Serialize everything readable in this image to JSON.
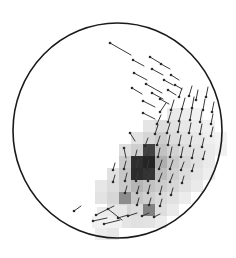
{
  "figure": {
    "title": "",
    "background_color": "#ffffff",
    "width": 236,
    "height": 258
  },
  "disk": {
    "label": "field-of-view-limb",
    "center_x": 117.5,
    "center_y": 130.5,
    "radius_x": 104.5,
    "radius_y": 107.5,
    "stroke_color": "#1a1a1a",
    "stroke_width": 1.6,
    "fill_color": "#ffffff"
  },
  "chart_data": {
    "type": "heatmap",
    "title": "",
    "xlabel": "",
    "ylabel": "",
    "grid": false,
    "legend_position": "none",
    "cell_size": 12,
    "origin_x": 83,
    "origin_y": 108,
    "colormap": "grayscale",
    "value_range": [
      0,
      1
    ],
    "color_stops": [
      {
        "value": 0.0,
        "hex": "#ffffff"
      },
      {
        "value": 0.15,
        "hex": "#ededed"
      },
      {
        "value": 0.3,
        "hex": "#dcdcdc"
      },
      {
        "value": 0.45,
        "hex": "#c4c4c4"
      },
      {
        "value": 0.6,
        "hex": "#a3a3a3"
      },
      {
        "value": 0.75,
        "hex": "#7a7a7a"
      },
      {
        "value": 0.9,
        "hex": "#4a4a4a"
      },
      {
        "value": 1.0,
        "hex": "#242424"
      }
    ],
    "cells": [
      {
        "col": 7,
        "row": 0,
        "value": 0.18
      },
      {
        "col": 8,
        "row": 0,
        "value": 0.14
      },
      {
        "col": 9,
        "row": 0,
        "value": 0.1
      },
      {
        "col": 5,
        "row": 1,
        "value": 0.22
      },
      {
        "col": 6,
        "row": 1,
        "value": 0.3
      },
      {
        "col": 7,
        "row": 1,
        "value": 0.26
      },
      {
        "col": 8,
        "row": 1,
        "value": 0.2
      },
      {
        "col": 9,
        "row": 1,
        "value": 0.16
      },
      {
        "col": 10,
        "row": 1,
        "value": 0.12
      },
      {
        "col": 4,
        "row": 2,
        "value": 0.24
      },
      {
        "col": 5,
        "row": 2,
        "value": 0.34
      },
      {
        "col": 6,
        "row": 2,
        "value": 0.4
      },
      {
        "col": 7,
        "row": 2,
        "value": 0.3
      },
      {
        "col": 8,
        "row": 2,
        "value": 0.24
      },
      {
        "col": 9,
        "row": 2,
        "value": 0.2
      },
      {
        "col": 10,
        "row": 2,
        "value": 0.14
      },
      {
        "col": 11,
        "row": 2,
        "value": 0.1
      },
      {
        "col": 3,
        "row": 3,
        "value": 0.28
      },
      {
        "col": 4,
        "row": 3,
        "value": 0.38
      },
      {
        "col": 5,
        "row": 3,
        "value": 0.92
      },
      {
        "col": 6,
        "row": 3,
        "value": 0.46
      },
      {
        "col": 7,
        "row": 3,
        "value": 0.36
      },
      {
        "col": 8,
        "row": 3,
        "value": 0.28
      },
      {
        "col": 9,
        "row": 3,
        "value": 0.24
      },
      {
        "col": 10,
        "row": 3,
        "value": 0.18
      },
      {
        "col": 11,
        "row": 3,
        "value": 0.12
      },
      {
        "col": 3,
        "row": 4,
        "value": 0.4
      },
      {
        "col": 4,
        "row": 4,
        "value": 0.97
      },
      {
        "col": 5,
        "row": 4,
        "value": 1.0
      },
      {
        "col": 6,
        "row": 4,
        "value": 0.55
      },
      {
        "col": 7,
        "row": 4,
        "value": 0.42
      },
      {
        "col": 8,
        "row": 4,
        "value": 0.34
      },
      {
        "col": 9,
        "row": 4,
        "value": 0.26
      },
      {
        "col": 10,
        "row": 4,
        "value": 0.18
      },
      {
        "col": 2,
        "row": 5,
        "value": 0.26
      },
      {
        "col": 3,
        "row": 5,
        "value": 0.44
      },
      {
        "col": 4,
        "row": 5,
        "value": 0.98
      },
      {
        "col": 5,
        "row": 5,
        "value": 0.96
      },
      {
        "col": 6,
        "row": 5,
        "value": 0.48
      },
      {
        "col": 7,
        "row": 5,
        "value": 0.38
      },
      {
        "col": 8,
        "row": 5,
        "value": 0.3
      },
      {
        "col": 9,
        "row": 5,
        "value": 0.22
      },
      {
        "col": 10,
        "row": 5,
        "value": 0.14
      },
      {
        "col": 1,
        "row": 6,
        "value": 0.2
      },
      {
        "col": 2,
        "row": 6,
        "value": 0.3
      },
      {
        "col": 3,
        "row": 6,
        "value": 0.42
      },
      {
        "col": 4,
        "row": 6,
        "value": 0.52
      },
      {
        "col": 5,
        "row": 6,
        "value": 0.46
      },
      {
        "col": 6,
        "row": 6,
        "value": 0.4
      },
      {
        "col": 7,
        "row": 6,
        "value": 0.34
      },
      {
        "col": 8,
        "row": 6,
        "value": 0.26
      },
      {
        "col": 9,
        "row": 6,
        "value": 0.18
      },
      {
        "col": 1,
        "row": 7,
        "value": 0.24
      },
      {
        "col": 2,
        "row": 7,
        "value": 0.34
      },
      {
        "col": 3,
        "row": 7,
        "value": 0.68
      },
      {
        "col": 4,
        "row": 7,
        "value": 0.44
      },
      {
        "col": 5,
        "row": 7,
        "value": 0.38
      },
      {
        "col": 6,
        "row": 7,
        "value": 0.32
      },
      {
        "col": 7,
        "row": 7,
        "value": 0.26
      },
      {
        "col": 8,
        "row": 7,
        "value": 0.16
      },
      {
        "col": 2,
        "row": 8,
        "value": 0.26
      },
      {
        "col": 3,
        "row": 8,
        "value": 0.34
      },
      {
        "col": 4,
        "row": 8,
        "value": 0.3
      },
      {
        "col": 5,
        "row": 8,
        "value": 0.72
      },
      {
        "col": 6,
        "row": 8,
        "value": 0.28
      },
      {
        "col": 7,
        "row": 8,
        "value": 0.18
      },
      {
        "col": 3,
        "row": 9,
        "value": 0.22
      },
      {
        "col": 4,
        "row": 9,
        "value": 0.26
      },
      {
        "col": 5,
        "row": 9,
        "value": 0.24
      },
      {
        "col": 6,
        "row": 9,
        "value": 0.16
      },
      {
        "col": 1,
        "row": 10,
        "value": 0.16
      },
      {
        "col": 2,
        "row": 10,
        "value": 0.2
      }
    ],
    "vectors_note": "Overlaid vector field: each glyph is a line segment with a filled dot marking its base point.",
    "vectors": [
      {
        "x": 110,
        "y": 43,
        "dx": 21,
        "dy": 12
      },
      {
        "x": 133,
        "y": 60,
        "dx": 11,
        "dy": 6
      },
      {
        "x": 150,
        "y": 57,
        "dx": 10,
        "dy": 6
      },
      {
        "x": 134,
        "y": 73,
        "dx": 13,
        "dy": 7
      },
      {
        "x": 152,
        "y": 69,
        "dx": 11,
        "dy": 6
      },
      {
        "x": 161,
        "y": 64,
        "dx": 9,
        "dy": 5
      },
      {
        "x": 146,
        "y": 84,
        "dx": 16,
        "dy": 9
      },
      {
        "x": 164,
        "y": 80,
        "dx": 9,
        "dy": 5
      },
      {
        "x": 171,
        "y": 75,
        "dx": 8,
        "dy": 5
      },
      {
        "x": 132,
        "y": 88,
        "dx": 10,
        "dy": 6
      },
      {
        "x": 152,
        "y": 93,
        "dx": 11,
        "dy": 6
      },
      {
        "x": 168,
        "y": 90,
        "dx": 8,
        "dy": 5
      },
      {
        "x": 175,
        "y": 85,
        "dx": 7,
        "dy": 4
      },
      {
        "x": 143,
        "y": 101,
        "dx": 12,
        "dy": 6
      },
      {
        "x": 160,
        "y": 99,
        "dx": 9,
        "dy": 5
      },
      {
        "x": 179,
        "y": 97,
        "dx": 3,
        "dy": -9
      },
      {
        "x": 189,
        "y": 96,
        "dx": 3,
        "dy": -10
      },
      {
        "x": 196,
        "y": 100,
        "dx": 2,
        "dy": -10
      },
      {
        "x": 206,
        "y": 97,
        "dx": 2,
        "dy": -10
      },
      {
        "x": 143,
        "y": 113,
        "dx": 12,
        "dy": 6
      },
      {
        "x": 160,
        "y": 112,
        "dx": 6,
        "dy": -9
      },
      {
        "x": 171,
        "y": 110,
        "dx": 3,
        "dy": -10
      },
      {
        "x": 182,
        "y": 109,
        "dx": 3,
        "dy": -11
      },
      {
        "x": 192,
        "y": 108,
        "dx": 2,
        "dy": -11
      },
      {
        "x": 203,
        "y": 110,
        "dx": 2,
        "dy": -11
      },
      {
        "x": 212,
        "y": 112,
        "dx": 2,
        "dy": -10
      },
      {
        "x": 157,
        "y": 124,
        "dx": 4,
        "dy": -9
      },
      {
        "x": 168,
        "y": 122,
        "dx": 3,
        "dy": -10
      },
      {
        "x": 179,
        "y": 121,
        "dx": 3,
        "dy": -11
      },
      {
        "x": 190,
        "y": 120,
        "dx": 2,
        "dy": -11
      },
      {
        "x": 200,
        "y": 122,
        "dx": 2,
        "dy": -11
      },
      {
        "x": 211,
        "y": 124,
        "dx": 2,
        "dy": -10
      },
      {
        "x": 130,
        "y": 133,
        "dx": 5,
        "dy": 8
      },
      {
        "x": 155,
        "y": 134,
        "dx": 3,
        "dy": -9
      },
      {
        "x": 167,
        "y": 133,
        "dx": 3,
        "dy": -10
      },
      {
        "x": 178,
        "y": 132,
        "dx": 2,
        "dy": -10
      },
      {
        "x": 189,
        "y": 133,
        "dx": 2,
        "dy": -10
      },
      {
        "x": 200,
        "y": 134,
        "dx": 2,
        "dy": -10
      },
      {
        "x": 211,
        "y": 136,
        "dx": 2,
        "dy": -9
      },
      {
        "x": 124,
        "y": 148,
        "dx": 2,
        "dy": 10
      },
      {
        "x": 145,
        "y": 146,
        "dx": 3,
        "dy": -8
      },
      {
        "x": 157,
        "y": 145,
        "dx": 3,
        "dy": -9
      },
      {
        "x": 168,
        "y": 145,
        "dx": 2,
        "dy": -10
      },
      {
        "x": 179,
        "y": 145,
        "dx": 2,
        "dy": -10
      },
      {
        "x": 190,
        "y": 146,
        "dx": 2,
        "dy": -10
      },
      {
        "x": 202,
        "y": 147,
        "dx": 2,
        "dy": -9
      },
      {
        "x": 135,
        "y": 158,
        "dx": 2,
        "dy": -8
      },
      {
        "x": 147,
        "y": 157,
        "dx": 2,
        "dy": -9
      },
      {
        "x": 158,
        "y": 157,
        "dx": 2,
        "dy": -9
      },
      {
        "x": 170,
        "y": 157,
        "dx": 2,
        "dy": -10
      },
      {
        "x": 181,
        "y": 157,
        "dx": 2,
        "dy": -10
      },
      {
        "x": 192,
        "y": 158,
        "dx": 2,
        "dy": -9
      },
      {
        "x": 203,
        "y": 159,
        "dx": 2,
        "dy": -8
      },
      {
        "x": 113,
        "y": 170,
        "dx": 2,
        "dy": -7
      },
      {
        "x": 124,
        "y": 169,
        "dx": 2,
        "dy": -8
      },
      {
        "x": 136,
        "y": 169,
        "dx": 2,
        "dy": -8
      },
      {
        "x": 147,
        "y": 169,
        "dx": 2,
        "dy": -9
      },
      {
        "x": 159,
        "y": 169,
        "dx": 3,
        "dy": -9
      },
      {
        "x": 170,
        "y": 169,
        "dx": 3,
        "dy": -9
      },
      {
        "x": 181,
        "y": 170,
        "dx": 3,
        "dy": -8
      },
      {
        "x": 192,
        "y": 171,
        "dx": 2,
        "dy": -7
      },
      {
        "x": 113,
        "y": 182,
        "dx": 2,
        "dy": -7
      },
      {
        "x": 125,
        "y": 181,
        "dx": 2,
        "dy": -8
      },
      {
        "x": 136,
        "y": 181,
        "dx": 2,
        "dy": -8
      },
      {
        "x": 148,
        "y": 181,
        "dx": 2,
        "dy": -8
      },
      {
        "x": 159,
        "y": 181,
        "dx": 3,
        "dy": -8
      },
      {
        "x": 170,
        "y": 182,
        "dx": 3,
        "dy": -8
      },
      {
        "x": 182,
        "y": 183,
        "dx": 2,
        "dy": -7
      },
      {
        "x": 125,
        "y": 193,
        "dx": 2,
        "dy": -7
      },
      {
        "x": 137,
        "y": 193,
        "dx": 2,
        "dy": -7
      },
      {
        "x": 148,
        "y": 193,
        "dx": 2,
        "dy": -8
      },
      {
        "x": 160,
        "y": 194,
        "dx": 2,
        "dy": -8
      },
      {
        "x": 171,
        "y": 195,
        "dx": 2,
        "dy": -7
      },
      {
        "x": 137,
        "y": 205,
        "dx": 2,
        "dy": -7
      },
      {
        "x": 149,
        "y": 205,
        "dx": 2,
        "dy": -7
      },
      {
        "x": 160,
        "y": 206,
        "dx": 2,
        "dy": -7
      },
      {
        "x": 74,
        "y": 211,
        "dx": 7,
        "dy": -5
      },
      {
        "x": 93,
        "y": 221,
        "dx": 14,
        "dy": -3
      },
      {
        "x": 96,
        "y": 215,
        "dx": 18,
        "dy": -9
      },
      {
        "x": 104,
        "y": 224,
        "dx": 16,
        "dy": -4
      },
      {
        "x": 108,
        "y": 209,
        "dx": 14,
        "dy": 11
      },
      {
        "x": 118,
        "y": 218,
        "dx": 10,
        "dy": -3
      },
      {
        "x": 128,
        "y": 216,
        "dx": 9,
        "dy": -3
      },
      {
        "x": 142,
        "y": 216,
        "dx": 7,
        "dy": -3
      },
      {
        "x": 154,
        "y": 217,
        "dx": 6,
        "dy": -3
      }
    ],
    "vector_style": {
      "line_color": "#3a3a3a",
      "line_width": 1.0,
      "dot_color": "#2b2b2b",
      "dot_radius": 1.3
    },
    "small_patches": [
      {
        "x": 97,
        "y": 207,
        "w": 26,
        "h": 10,
        "value": 0.16
      },
      {
        "x": 92,
        "y": 216,
        "w": 30,
        "h": 12,
        "value": 0.12
      },
      {
        "x": 113,
        "y": 205,
        "w": 14,
        "h": 12,
        "value": 0.2
      }
    ]
  }
}
